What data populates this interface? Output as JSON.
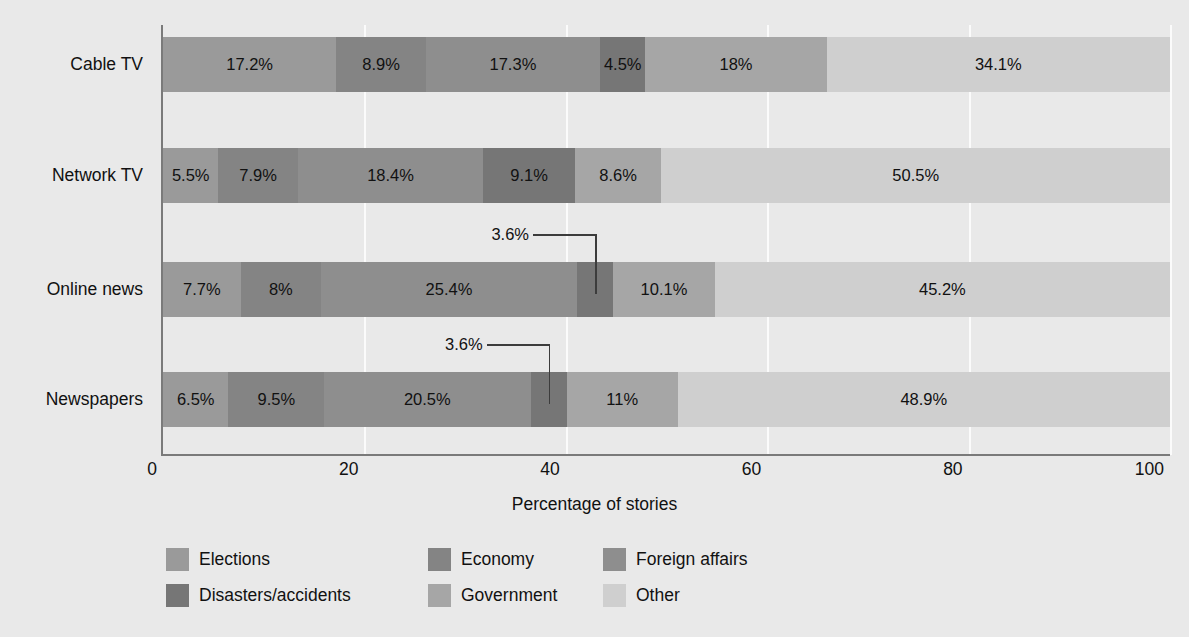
{
  "chart_data": {
    "type": "bar",
    "subtype": "stacked-horizontal-100",
    "title": "",
    "xlabel": "Percentage of stories",
    "ylabel": "",
    "xlim": [
      0,
      100
    ],
    "xticks": [
      0,
      20,
      40,
      60,
      80,
      100
    ],
    "xtick_labels": [
      "0",
      "20",
      "40",
      "60",
      "80",
      "100"
    ],
    "grid": true,
    "grid_axis": "x",
    "legend_position": "bottom-left",
    "categories": [
      "Cable TV",
      "Network TV",
      "Online news",
      "Newspapers"
    ],
    "series": [
      {
        "name": "Elections",
        "color": "#9a9a9a",
        "values": [
          17.2,
          5.5,
          7.7,
          6.5
        ]
      },
      {
        "name": "Economy",
        "color": "#848484",
        "values": [
          8.9,
          7.9,
          8.0,
          9.5
        ]
      },
      {
        "name": "Foreign affairs",
        "color": "#8e8e8e",
        "values": [
          17.3,
          18.4,
          25.4,
          20.5
        ]
      },
      {
        "name": "Disasters/accidents",
        "color": "#767676",
        "values": [
          4.5,
          9.1,
          3.6,
          3.6
        ]
      },
      {
        "name": "Government",
        "color": "#a6a6a6",
        "values": [
          18.0,
          8.6,
          10.1,
          11.0
        ]
      },
      {
        "name": "Other",
        "color": "#cfcfcf",
        "values": [
          34.1,
          50.5,
          45.2,
          48.9
        ]
      }
    ],
    "data_labels": {
      "Cable TV": [
        "17.2%",
        "8.9%",
        "17.3%",
        "4.5%",
        "18%",
        "34.1%"
      ],
      "Network TV": [
        "5.5%",
        "7.9%",
        "18.4%",
        "9.1%",
        "8.6%",
        "50.5%"
      ],
      "Online news": [
        "7.7%",
        "8%",
        "25.4%",
        "3.6%",
        "10.1%",
        "45.2%"
      ],
      "Newspapers": [
        "6.5%",
        "9.5%",
        "20.5%",
        "3.6%",
        "11%",
        "48.9%"
      ]
    },
    "callouts": [
      {
        "row": "Online news",
        "series": "Disasters/accidents",
        "label": "3.6%"
      },
      {
        "row": "Newspapers",
        "series": "Disasters/accidents",
        "label": "3.6%"
      }
    ]
  },
  "axis": {
    "x_title": "Percentage of stories",
    "ticks": [
      "0",
      "20",
      "40",
      "60",
      "80",
      "100"
    ]
  },
  "categories": [
    {
      "label": "Cable TV"
    },
    {
      "label": "Network TV"
    },
    {
      "label": "Online news"
    },
    {
      "label": "Newspapers"
    }
  ],
  "legend": {
    "items": [
      {
        "label": "Elections",
        "color": "#9a9a9a"
      },
      {
        "label": "Economy",
        "color": "#848484"
      },
      {
        "label": "Foreign affairs",
        "color": "#8e8e8e"
      },
      {
        "label": "Disasters/accidents",
        "color": "#767676"
      },
      {
        "label": "Government",
        "color": "#a6a6a6"
      },
      {
        "label": "Other",
        "color": "#cfcfcf"
      }
    ]
  },
  "theme": {
    "background": "#e9e9e9",
    "axis_color": "#7a7a7a",
    "grid_color": "#fbfbfb",
    "text_color": "#111111"
  }
}
